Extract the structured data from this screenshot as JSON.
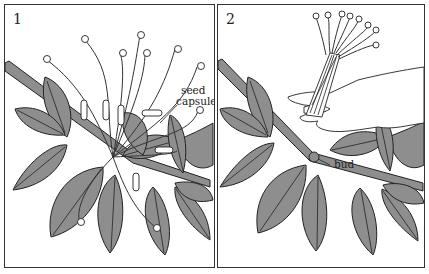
{
  "figure": {
    "panels": [
      {
        "number": "1",
        "labels": [
          {
            "text_line1": "seed",
            "text_line2": "capsule"
          }
        ]
      },
      {
        "number": "2",
        "labels": [
          {
            "text": "bud"
          }
        ]
      }
    ],
    "colors": {
      "leaf_fill": "#8e8e8e",
      "line": "#222222",
      "background": "#ffffff"
    }
  }
}
